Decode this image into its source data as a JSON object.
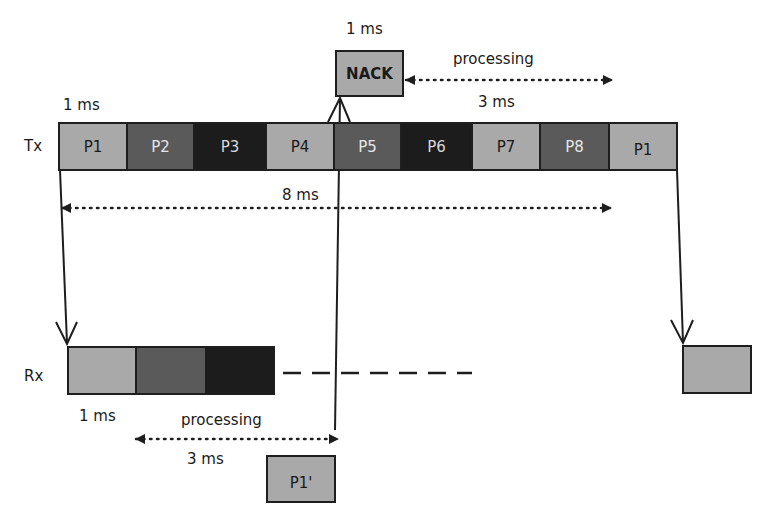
{
  "colors": {
    "light": "#a9a9a9",
    "medium": "#5a5a5a",
    "dark": "#1c1c1c",
    "line": "#1e1e1e"
  },
  "nack": {
    "label": "NACK",
    "duration": "1 ms"
  },
  "tx": {
    "row_label": "Tx",
    "duration_label": "1 ms",
    "packets": [
      {
        "label": "P1",
        "shade": "light"
      },
      {
        "label": "P2",
        "shade": "medium"
      },
      {
        "label": "P3",
        "shade": "dark"
      },
      {
        "label": "P4",
        "shade": "light"
      },
      {
        "label": "P5",
        "shade": "medium"
      },
      {
        "label": "P6",
        "shade": "dark"
      },
      {
        "label": "P7",
        "shade": "light"
      },
      {
        "label": "P8",
        "shade": "medium"
      },
      {
        "label": "P1",
        "shade": "light"
      }
    ]
  },
  "rx": {
    "row_label": "Rx",
    "duration_label": "1 ms",
    "packets": [
      {
        "label": "",
        "shade": "light"
      },
      {
        "label": "",
        "shade": "medium"
      },
      {
        "label": "",
        "shade": "dark"
      }
    ],
    "retransmit_box": {
      "label": "",
      "shade": "light"
    }
  },
  "retransmission": {
    "label": "P1'"
  },
  "annotations": {
    "top_processing": {
      "label": "processing",
      "duration": "3 ms"
    },
    "rtt": {
      "label": "8 ms"
    },
    "bottom_processing": {
      "label": "processing",
      "duration": "3 ms"
    }
  }
}
